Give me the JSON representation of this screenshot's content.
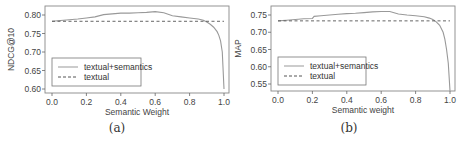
{
  "chart_data": [
    {
      "type": "line",
      "caption": "(a)",
      "xlabel": "Semantic Weight",
      "ylabel": "NDCG@10",
      "xlim": [
        0.0,
        1.0
      ],
      "ylim": [
        0.6,
        0.8
      ],
      "xticks": [
        "0.0",
        "0.2",
        "0.4",
        "0.6",
        "0.8",
        "1.0"
      ],
      "yticks": [
        "0.60",
        "0.65",
        "0.70",
        "0.75",
        "0.80"
      ],
      "grid": false,
      "legend_position": "lower-left",
      "series": [
        {
          "name": "textual+semantics",
          "style": "solid",
          "x": [
            0.0,
            0.05,
            0.1,
            0.15,
            0.2,
            0.25,
            0.3,
            0.35,
            0.4,
            0.45,
            0.5,
            0.55,
            0.6,
            0.65,
            0.7,
            0.75,
            0.8,
            0.85,
            0.88,
            0.9,
            0.92,
            0.94,
            0.96,
            0.97,
            0.98,
            0.99,
            1.0
          ],
          "y": [
            0.783,
            0.785,
            0.787,
            0.789,
            0.792,
            0.795,
            0.801,
            0.803,
            0.805,
            0.805,
            0.806,
            0.807,
            0.809,
            0.806,
            0.798,
            0.795,
            0.792,
            0.789,
            0.786,
            0.781,
            0.775,
            0.767,
            0.755,
            0.745,
            0.73,
            0.7,
            0.6
          ]
        },
        {
          "name": "textual",
          "style": "dashed",
          "x": [
            0.0,
            1.0
          ],
          "y": [
            0.783,
            0.783
          ]
        }
      ]
    },
    {
      "type": "line",
      "caption": "(b)",
      "xlabel": "Semantic weight",
      "ylabel": "MAP",
      "xlim": [
        0.0,
        1.0
      ],
      "ylim": [
        0.55,
        0.75
      ],
      "xticks": [
        "0.0",
        "0.2",
        "0.4",
        "0.6",
        "0.8",
        "1.0"
      ],
      "yticks": [
        "0.55",
        "0.60",
        "0.65",
        "0.70",
        "0.75"
      ],
      "grid": false,
      "legend_position": "lower-left",
      "series": [
        {
          "name": "textual+semantics",
          "style": "solid",
          "x": [
            0.0,
            0.05,
            0.1,
            0.15,
            0.2,
            0.21,
            0.25,
            0.3,
            0.35,
            0.4,
            0.45,
            0.5,
            0.55,
            0.6,
            0.65,
            0.7,
            0.75,
            0.8,
            0.85,
            0.88,
            0.9,
            0.92,
            0.94,
            0.96,
            0.97,
            0.98,
            0.99,
            1.0
          ],
          "y": [
            0.733,
            0.735,
            0.737,
            0.739,
            0.74,
            0.746,
            0.748,
            0.75,
            0.752,
            0.754,
            0.755,
            0.757,
            0.759,
            0.76,
            0.76,
            0.753,
            0.75,
            0.748,
            0.745,
            0.741,
            0.737,
            0.73,
            0.72,
            0.7,
            0.68,
            0.65,
            0.61,
            0.53
          ]
        },
        {
          "name": "textual",
          "style": "dashed",
          "x": [
            0.0,
            1.0
          ],
          "y": [
            0.733,
            0.733
          ]
        }
      ]
    }
  ]
}
